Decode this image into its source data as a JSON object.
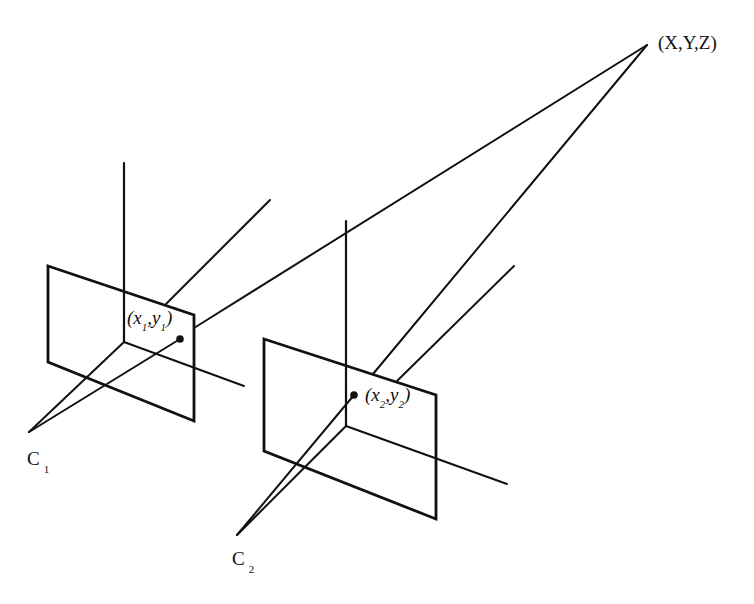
{
  "diagram": {
    "world_point": {
      "label": "(X,Y,Z)"
    },
    "camera1": {
      "center_label": "C",
      "center_sub": "1",
      "image_point": {
        "open": "(",
        "x": "x",
        "x_sub": "1",
        "comma": ",",
        "y": "y",
        "y_sub": "1",
        "close": ")"
      }
    },
    "camera2": {
      "center_label": "C",
      "center_sub": "2",
      "image_point": {
        "open": "(",
        "x": "x",
        "x_sub": "2",
        "comma": ",",
        "y": "y",
        "y_sub": "2",
        "close": ")"
      }
    },
    "colors": {
      "stroke": "#111111",
      "background": "#ffffff"
    }
  }
}
